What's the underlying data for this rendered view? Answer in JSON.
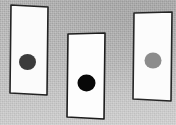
{
  "scene": {
    "width": 176,
    "height": 125,
    "background_color": "#bcbcbc",
    "background_texture": "gray-canvas-paper-noise",
    "description": "Three hand-drawn white rectangular cards on textured gray paper, each marked with one filled circle"
  },
  "cards": [
    {
      "id": "card-left",
      "label": "Left card",
      "fill_color": "#fbfbfb",
      "stroke_color": "#232323",
      "stroke_width": 1.6,
      "outline_points": "11,5 48,7 47,95 10,93",
      "dot": {
        "id": "dot-left",
        "label": "Dark gray dot",
        "cx": 27.5,
        "cy": 62,
        "rx": 8.5,
        "ry": 8,
        "color": "#3b3b3b",
        "shade_name": "dark-gray"
      }
    },
    {
      "id": "card-middle",
      "label": "Middle card",
      "fill_color": "#fdfdfd",
      "stroke_color": "#1d1d1d",
      "stroke_width": 1.6,
      "outline_points": "68,34 105,33 104,119 67,117",
      "dot": {
        "id": "dot-middle",
        "label": "Black dot",
        "cx": 86.5,
        "cy": 83,
        "rx": 9,
        "ry": 8.5,
        "color": "#080808",
        "shade_name": "black"
      }
    },
    {
      "id": "card-right",
      "label": "Right card",
      "fill_color": "#fcfcfc",
      "stroke_color": "#262626",
      "stroke_width": 1.6,
      "outline_points": "134,13 172,12 171,101 133,99",
      "dot": {
        "id": "dot-right",
        "label": "Medium gray dot",
        "cx": 153,
        "cy": 60.5,
        "rx": 8.5,
        "ry": 8,
        "color": "#8c8c8c",
        "shade_name": "medium-gray"
      }
    }
  ]
}
